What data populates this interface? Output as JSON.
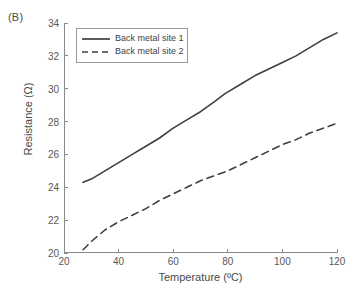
{
  "panel": {
    "label": "(B)"
  },
  "chart_data": {
    "type": "line",
    "title": "",
    "subtitle": "",
    "xlabel": "Temperature (ºC)",
    "ylabel": "Resistance (Ω)",
    "xlim": [
      20,
      120
    ],
    "ylim": [
      20,
      34
    ],
    "xticks": [
      20,
      40,
      60,
      80,
      100,
      120
    ],
    "yticks": [
      20,
      22,
      24,
      26,
      28,
      30,
      32,
      34
    ],
    "grid": false,
    "legend_position": "top-left",
    "annotations": [
      "(B)"
    ],
    "series": [
      {
        "name": "Back metal site 1",
        "style": "solid",
        "color": "#3f3f3f",
        "x": [
          27,
          30,
          35,
          40,
          45,
          50,
          55,
          60,
          65,
          70,
          75,
          79,
          85,
          90,
          95,
          100,
          105,
          110,
          115,
          120
        ],
        "y": [
          24.3,
          24.5,
          25.0,
          25.5,
          26.0,
          26.5,
          27.0,
          27.6,
          28.1,
          28.6,
          29.2,
          29.7,
          30.3,
          30.8,
          31.2,
          31.6,
          32.0,
          32.5,
          33.0,
          33.4
        ]
      },
      {
        "name": "Back metal site 2",
        "style": "dashed",
        "color": "#3f3f3f",
        "x": [
          27,
          30,
          35,
          40,
          45,
          50,
          55,
          60,
          65,
          70,
          75,
          80,
          85,
          90,
          95,
          100,
          105,
          110,
          115,
          120
        ],
        "y": [
          20.2,
          20.7,
          21.4,
          21.9,
          22.3,
          22.7,
          23.2,
          23.6,
          24.0,
          24.4,
          24.7,
          25.0,
          25.4,
          25.8,
          26.2,
          26.6,
          26.9,
          27.3,
          27.6,
          27.9
        ]
      }
    ]
  },
  "legend": {
    "items": [
      {
        "label": "Back metal site 1"
      },
      {
        "label": "Back metal site 2"
      }
    ]
  }
}
